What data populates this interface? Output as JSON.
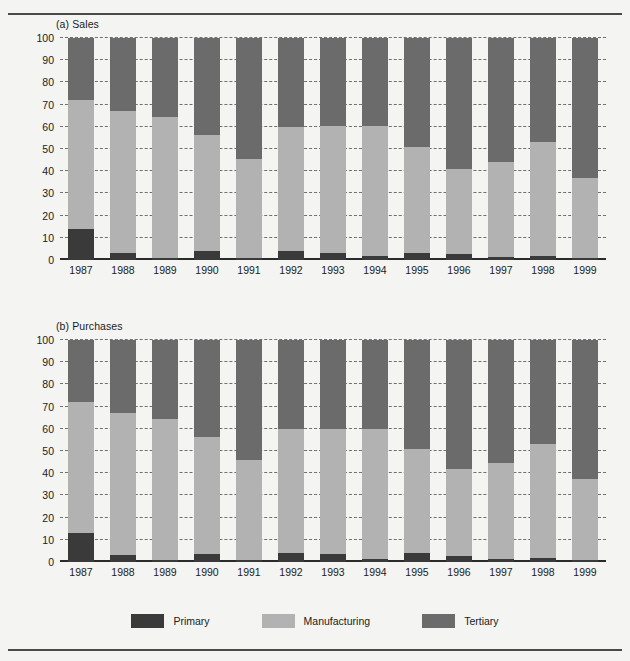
{
  "figure": {
    "legend": {
      "items": [
        {
          "label": "Primary",
          "color": "#3a3a3a",
          "key": "primary"
        },
        {
          "label": "Manufacturing",
          "color": "#b2b2b2",
          "key": "manufacturing"
        },
        {
          "label": "Tertiary",
          "color": "#6b6b6b",
          "key": "tertiary"
        }
      ]
    }
  },
  "panel_a": {
    "title": "(a) Sales"
  },
  "panel_b": {
    "title": "(b) Purchases"
  },
  "chart_data": [
    {
      "type": "bar",
      "stacked": true,
      "title": "(a) Sales",
      "xlabel": "",
      "ylabel": "",
      "ylim": [
        0,
        100
      ],
      "yticks": [
        0,
        10,
        20,
        30,
        40,
        50,
        60,
        70,
        80,
        90,
        100
      ],
      "ytick_labels": [
        "0",
        "10",
        "20",
        "30",
        "40",
        "50",
        "60",
        "70",
        "80",
        "90",
        "100"
      ],
      "grid": true,
      "legend_position": "bottom",
      "categories": [
        "1987",
        "1988",
        "1989",
        "1990",
        "1991",
        "1992",
        "1993",
        "1994",
        "1995",
        "1996",
        "1997",
        "1998",
        "1999"
      ],
      "series": [
        {
          "name": "Primary",
          "color": "#3a3a3a",
          "values": [
            14,
            3,
            1,
            4,
            1,
            4,
            3,
            2,
            3,
            2.5,
            1.5,
            2,
            1
          ]
        },
        {
          "name": "Manufacturing",
          "color": "#b2b2b2",
          "values": [
            58,
            64,
            63.5,
            52.5,
            44.5,
            56,
            57.5,
            58.5,
            48,
            38.5,
            42.5,
            51,
            36
          ]
        },
        {
          "name": "Tertiary",
          "color": "#6b6b6b",
          "values": [
            28,
            33,
            35.5,
            43.5,
            54.5,
            40,
            39.5,
            39.5,
            49,
            59,
            56,
            47,
            63
          ]
        }
      ],
      "cumulative_tops": {
        "primary": [
          14,
          3,
          1,
          4,
          1,
          4,
          3,
          2,
          3,
          2.5,
          1.5,
          2,
          1
        ],
        "manufacturing": [
          72,
          67,
          64.5,
          56.5,
          45.5,
          60,
          60.5,
          60.5,
          51,
          41,
          44,
          53,
          37
        ],
        "tertiary": [
          100,
          100,
          100,
          100,
          100,
          100,
          100,
          100,
          100,
          100,
          100,
          100,
          100
        ]
      }
    },
    {
      "type": "bar",
      "stacked": true,
      "title": "(b) Purchases",
      "xlabel": "",
      "ylabel": "",
      "ylim": [
        0,
        100
      ],
      "yticks": [
        0,
        10,
        20,
        30,
        40,
        50,
        60,
        70,
        80,
        90,
        100
      ],
      "ytick_labels": [
        "0",
        "10",
        "20",
        "30",
        "40",
        "50",
        "60",
        "70",
        "80",
        "90",
        "100"
      ],
      "grid": true,
      "legend_position": "bottom",
      "categories": [
        "1987",
        "1988",
        "1989",
        "1990",
        "1991",
        "1992",
        "1993",
        "1994",
        "1995",
        "1996",
        "1997",
        "1998",
        "1999"
      ],
      "series": [
        {
          "name": "Primary",
          "color": "#3a3a3a",
          "values": [
            13,
            3,
            1,
            3.5,
            1,
            4,
            3.5,
            1.5,
            4,
            2.5,
            1.5,
            2,
            1
          ]
        },
        {
          "name": "Manufacturing",
          "color": "#b2b2b2",
          "values": [
            59,
            64,
            63.5,
            53,
            45,
            56,
            56.5,
            58.5,
            47,
            39.5,
            43,
            51,
            36.5
          ]
        },
        {
          "name": "Tertiary",
          "color": "#6b6b6b",
          "values": [
            28,
            33,
            35.5,
            43.5,
            54,
            40,
            40,
            40,
            49,
            58,
            55.5,
            47,
            62.5
          ]
        }
      ],
      "cumulative_tops": {
        "primary": [
          13,
          3,
          1,
          3.5,
          1,
          4,
          3.5,
          1.5,
          4,
          2.5,
          1.5,
          2,
          1
        ],
        "manufacturing": [
          72,
          67,
          64.5,
          56.5,
          46,
          60,
          60,
          60,
          51,
          42,
          44.5,
          53,
          37.5
        ],
        "tertiary": [
          100,
          100,
          100,
          100,
          100,
          100,
          100,
          100,
          100,
          100,
          100,
          100,
          100
        ]
      }
    }
  ]
}
